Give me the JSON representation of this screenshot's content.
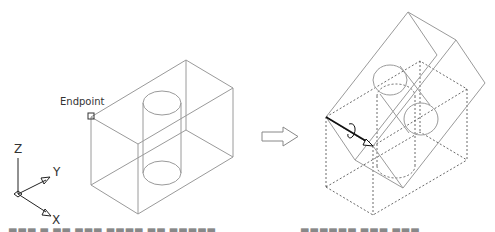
{
  "figure": {
    "left_view": {
      "snap_label": "Endpoint",
      "description": "Wireframe box with vertical cylinder hole"
    },
    "transition_arrow": "arrow-right",
    "right_view": {
      "description": "Box rotated about edge through Endpoint; original box shown dashed"
    },
    "ucs_icon": {
      "axis_z": "Z",
      "axis_y": "Y",
      "axis_x": "X"
    },
    "colors": {
      "geometry": "#9a9a9a",
      "hidden_lines": "#444444",
      "rotation_axis": "#222222"
    }
  }
}
